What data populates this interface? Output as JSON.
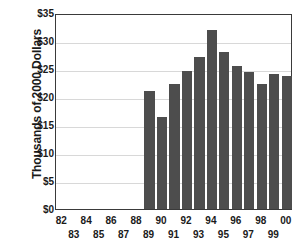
{
  "chart_data": {
    "type": "bar",
    "title": "",
    "subtitle": "",
    "xlabel": "",
    "ylabel": "Thousands of 2000 Dollars",
    "categories": [
      "82",
      "83",
      "84",
      "85",
      "86",
      "87",
      "88",
      "89",
      "90",
      "91",
      "92",
      "93",
      "94",
      "95",
      "96",
      "97",
      "98",
      "99",
      "00"
    ],
    "values": [
      null,
      null,
      null,
      null,
      null,
      null,
      null,
      21.1,
      16.4,
      22.3,
      24.6,
      27.2,
      32.0,
      28.1,
      25.6,
      24.4,
      22.4,
      24.1,
      23.7
    ],
    "ylim": [
      0,
      35
    ],
    "ytick_values": [
      0,
      5,
      10,
      15,
      20,
      25,
      30,
      35
    ],
    "ytick_labels": [
      "$0",
      "$5",
      "$10",
      "$15",
      "$20",
      "$25",
      "$30",
      "$35"
    ],
    "grid": true,
    "legend": false,
    "bar_color": "#4d4d4d",
    "gridline_color": "#d8d8d8",
    "axis_color": "#3a3a3a",
    "xtick_rows": {
      "top": [
        "82",
        "84",
        "86",
        "88",
        "90",
        "92",
        "94",
        "96",
        "98",
        "00"
      ],
      "bottom": [
        "83",
        "85",
        "87",
        "89",
        "91",
        "93",
        "95",
        "97",
        "99"
      ]
    }
  }
}
